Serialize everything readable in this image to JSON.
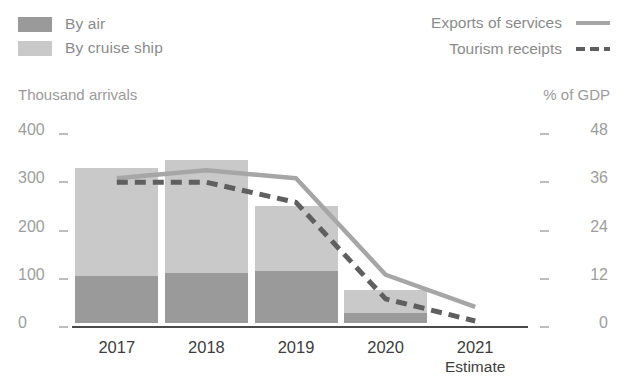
{
  "legend_left": {
    "items": [
      {
        "label": "By air",
        "color": "#9a9a9a",
        "icon": "square-swatch-icon"
      },
      {
        "label": "By cruise ship",
        "color": "#c9c9c9",
        "icon": "square-swatch-icon"
      }
    ]
  },
  "legend_right": {
    "items": [
      {
        "label": "Exports of services",
        "style": "solid",
        "color": "#a6a6a6",
        "icon": "solid-line-icon"
      },
      {
        "label": "Tourism receipts",
        "style": "dashed",
        "color": "#5f5f5f",
        "icon": "dashed-line-icon"
      }
    ]
  },
  "axis_titles": {
    "left": "Thousand arrivals",
    "right": "% of GDP"
  },
  "x_note": "Estimate",
  "chart_data": {
    "type": "bar",
    "title": "",
    "subtitle": "",
    "xlabel": "",
    "ylabel": "Thousand arrivals",
    "y2label": "% of GDP",
    "grid": false,
    "legend_position": "top",
    "categories": [
      "2017",
      "2018",
      "2019",
      "2020",
      "2021"
    ],
    "x_sublabels": [
      "",
      "",
      "",
      "",
      "Estimate"
    ],
    "ylim": [
      0,
      400
    ],
    "yticks": [
      0,
      100,
      200,
      300,
      400
    ],
    "ytick_labels": [
      "0",
      "100",
      "200",
      "300",
      "400"
    ],
    "y2lim": [
      0,
      48
    ],
    "y2ticks": [
      0,
      12,
      24,
      36,
      48
    ],
    "y2tick_labels": [
      "0",
      "12",
      "24",
      "36",
      "48"
    ],
    "series": [
      {
        "name": "By air",
        "type": "bar",
        "axis": "left",
        "stack": "arrivals",
        "color": "#9a9a9a",
        "values": [
          98,
          104,
          108,
          20,
          0
        ]
      },
      {
        "name": "By cruise ship",
        "type": "bar",
        "axis": "left",
        "stack": "arrivals",
        "color": "#c9c9c9",
        "values": [
          224,
          233,
          135,
          48,
          0
        ]
      },
      {
        "name": "Exports of services",
        "type": "line",
        "axis": "right",
        "style": "solid",
        "color": "#a6a6a6",
        "values": [
          36,
          38,
          36,
          12,
          4
        ]
      },
      {
        "name": "Tourism receipts",
        "type": "line",
        "axis": "right",
        "style": "dashed",
        "color": "#5f5f5f",
        "values": [
          35,
          35,
          30,
          6,
          0.5
        ]
      }
    ],
    "totals": [
      322,
      337,
      243,
      68,
      0
    ]
  }
}
